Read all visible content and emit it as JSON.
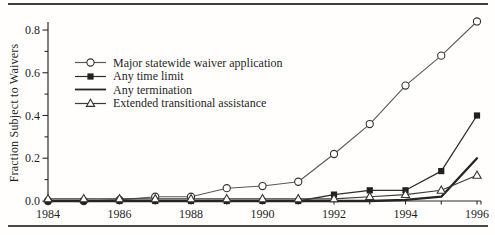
{
  "chart_data": {
    "type": "line",
    "title": "",
    "xlabel": "",
    "ylabel": "Fraction Subject to Waivers",
    "x": [
      1984,
      1985,
      1986,
      1987,
      1988,
      1989,
      1990,
      1991,
      1992,
      1993,
      1994,
      1995,
      1996
    ],
    "x_tick_labels": [
      "1984",
      "1986",
      "1988",
      "1990",
      "1992",
      "1994",
      "1996"
    ],
    "y_tick_labels": [
      "0.0",
      "0.2",
      "0.4",
      "0.6",
      "0.8"
    ],
    "y_minor_tick_step": 0.1,
    "xlim": [
      1984,
      1996
    ],
    "ylim": [
      0,
      0.85
    ],
    "grid": false,
    "legend_position": "upper-left-inside",
    "series": [
      {
        "name": "Major statewide waiver application",
        "marker": "circle",
        "values": [
          0,
          0,
          0.005,
          0.02,
          0.02,
          0.06,
          0.07,
          0.09,
          0.22,
          0.36,
          0.54,
          0.68,
          0.84
        ]
      },
      {
        "name": "Any time limit",
        "marker": "square",
        "values": [
          0,
          0,
          0,
          0,
          0,
          0,
          0,
          0,
          0.03,
          0.05,
          0.05,
          0.14,
          0.4
        ]
      },
      {
        "name": "Any termination",
        "marker": "none",
        "values": [
          0,
          0,
          0,
          0,
          0,
          0,
          0,
          0,
          0,
          0,
          0.005,
          0.02,
          0.2
        ]
      },
      {
        "name": "Extended transitional assistance",
        "marker": "triangle",
        "values": [
          0.01,
          0.01,
          0.01,
          0.01,
          0.01,
          0.01,
          0.01,
          0.01,
          0.01,
          0.02,
          0.03,
          0.05,
          0.12
        ]
      }
    ],
    "colors": {
      "ink": "#1f1f1f",
      "axis": "#2b2b2b",
      "circle_line": "#595959",
      "square_line": "#2e2e2e",
      "termination_line": "#242424",
      "triangle_line": "#3a3a3a",
      "marker_fill_open": "#ffffff",
      "marker_fill_solid": "#202020",
      "background": "#ffffff"
    }
  }
}
